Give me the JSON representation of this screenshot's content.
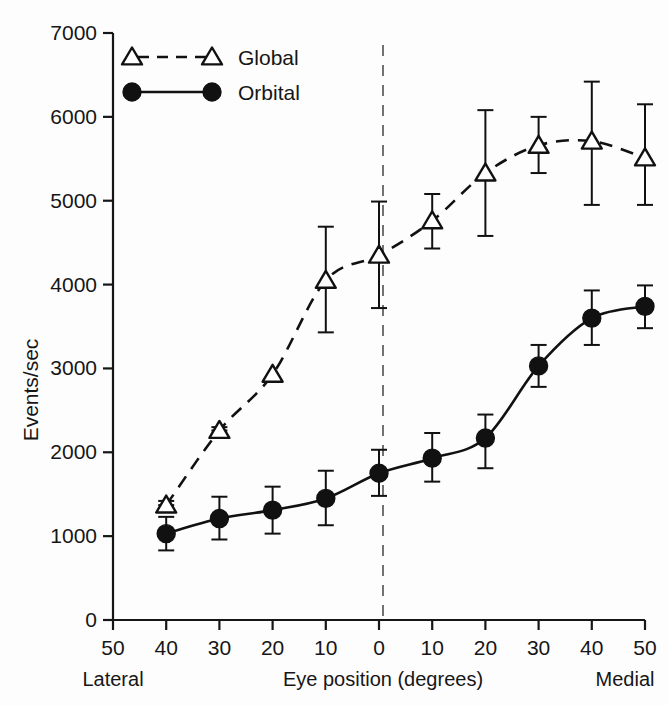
{
  "chart_data": {
    "type": "line",
    "title": "",
    "xlabel": "Eye position (degrees)",
    "ylabel": "Events/sec",
    "grid": false,
    "legend_position": "top-left",
    "x": [
      -40,
      -30,
      -20,
      -10,
      0,
      10,
      20,
      30,
      40,
      50
    ],
    "xtick_values": [
      -50,
      -40,
      -30,
      -20,
      -10,
      0,
      10,
      20,
      30,
      40,
      50
    ],
    "xtick_labels": [
      "50",
      "40",
      "30",
      "20",
      "10",
      "0",
      "10",
      "20",
      "30",
      "40",
      "50"
    ],
    "ytick_values": [
      0,
      1000,
      2000,
      3000,
      4000,
      5000,
      6000,
      7000
    ],
    "ytick_labels": [
      "0",
      "1000",
      "2000",
      "3000",
      "4000",
      "5000",
      "6000",
      "7000"
    ],
    "xlim": [
      -50,
      50
    ],
    "ylim": [
      0,
      7000
    ],
    "x_axis_left_label": "Lateral",
    "x_axis_right_label": "Medial",
    "reference_line_x": 0,
    "reference_line_style": "dashed-vertical",
    "series": [
      {
        "name": "Global",
        "marker": "open-triangle",
        "line_style": "dashed",
        "values": [
          1370,
          2260,
          2930,
          4050,
          4350,
          4760,
          5330,
          5660,
          5710,
          5510
        ],
        "error_low": [
          1370,
          2260,
          2930,
          3430,
          3720,
          4430,
          4580,
          5330,
          4950,
          4950
        ],
        "error_high": [
          1420,
          2300,
          2960,
          4690,
          4990,
          5080,
          6080,
          6000,
          6420,
          6150
        ]
      },
      {
        "name": "Orbital",
        "marker": "filled-circle",
        "line_style": "solid",
        "values": [
          1030,
          1210,
          1310,
          1450,
          1750,
          1930,
          2170,
          3030,
          3600,
          3740
        ],
        "error_low": [
          830,
          960,
          1030,
          1130,
          1480,
          1650,
          1810,
          2780,
          3280,
          3480
        ],
        "error_high": [
          1230,
          1470,
          1590,
          1780,
          2030,
          2230,
          2450,
          3280,
          3930,
          3990
        ]
      }
    ]
  },
  "legend": {
    "items": [
      {
        "label": "Global"
      },
      {
        "label": "Orbital"
      }
    ]
  },
  "axes": {
    "y_title": "Events/sec",
    "x_title": "Eye position (degrees)",
    "x_left_end": "Lateral",
    "x_right_end": "Medial"
  }
}
